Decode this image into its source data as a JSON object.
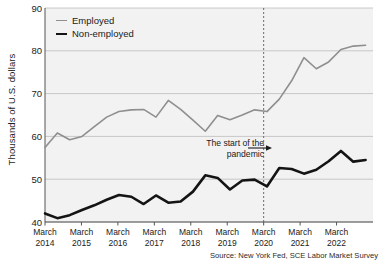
{
  "chart_data": {
    "type": "line",
    "title": "",
    "subtitle": "",
    "xlabel": "",
    "ylabel": "Thousands of U.S. dollars",
    "ylim": [
      40,
      90
    ],
    "yticks": [
      40,
      50,
      60,
      70,
      80,
      90
    ],
    "ytick_labels": [
      "40",
      "50",
      "60",
      "70",
      "80",
      "90"
    ],
    "grid": true,
    "grid_axis": "y",
    "legend_position": "top-left",
    "xtick_labels": [
      [
        "March",
        "2014"
      ],
      [
        "March",
        "2015"
      ],
      [
        "March",
        "2016"
      ],
      [
        "March",
        "2017"
      ],
      [
        "March",
        "2018"
      ],
      [
        "March",
        "2019"
      ],
      [
        "March",
        "2020"
      ],
      [
        "March",
        "2021"
      ],
      [
        "March",
        "2022"
      ]
    ],
    "x": [
      "2014-03",
      "2014-07",
      "2014-11",
      "2015-03",
      "2015-07",
      "2015-11",
      "2016-03",
      "2016-07",
      "2016-11",
      "2017-03",
      "2017-07",
      "2017-11",
      "2018-03",
      "2018-07",
      "2018-11",
      "2019-03",
      "2019-07",
      "2019-11",
      "2020-03",
      "2020-07",
      "2020-11",
      "2021-03",
      "2021-07",
      "2021-11",
      "2022-03",
      "2022-07",
      "2022-11"
    ],
    "series": [
      {
        "name": "Employed",
        "color": "#8f8f8f",
        "width": 1.6,
        "values": [
          57.4,
          60.8,
          59.2,
          60.0,
          62.3,
          64.5,
          65.8,
          66.2,
          66.3,
          64.5,
          68.4,
          66.3,
          63.8,
          61.2,
          64.9,
          63.9,
          65.0,
          66.2,
          65.8,
          68.7,
          73.0,
          78.4,
          75.8,
          77.4,
          80.3,
          81.1,
          81.3
        ]
      },
      {
        "name": "Non-employed",
        "color": "#141414",
        "width": 2.6,
        "values": [
          42.0,
          40.9,
          41.6,
          42.8,
          43.9,
          45.2,
          46.3,
          45.9,
          44.2,
          46.2,
          44.5,
          44.8,
          47.1,
          50.9,
          50.3,
          47.6,
          49.7,
          49.9,
          48.3,
          52.6,
          52.4,
          51.3,
          52.2,
          54.2,
          56.6,
          54.1,
          54.5
        ]
      }
    ],
    "annotations": [
      {
        "name": "pandemic-marker",
        "text": "The start of the\npandemic",
        "text_line1": "The start of the",
        "text_line2": "pandemic",
        "x": "2020-03",
        "marker": "vertical-dashed-line",
        "arrow": true
      }
    ],
    "source": "Source: New York Fed, SCE Labor Market Survey"
  },
  "legend": {
    "items": [
      {
        "label": "Employed"
      },
      {
        "label": "Non-employed"
      }
    ]
  },
  "axes": {
    "ylabel": "Thousands of U.S. dollars",
    "yticks": [
      "90",
      "80",
      "70",
      "60",
      "50",
      "40"
    ],
    "xticks": [
      {
        "month": "March",
        "year": "2014"
      },
      {
        "month": "March",
        "year": "2015"
      },
      {
        "month": "March",
        "year": "2016"
      },
      {
        "month": "March",
        "year": "2017"
      },
      {
        "month": "March",
        "year": "2018"
      },
      {
        "month": "March",
        "year": "2019"
      },
      {
        "month": "March",
        "year": "2020"
      },
      {
        "month": "March",
        "year": "2021"
      },
      {
        "month": "March",
        "year": "2022"
      }
    ]
  },
  "annotation": {
    "line1": "The start of the",
    "line2": "pandemic"
  },
  "source": {
    "text": "Source: New York Fed, SCE Labor Market Survey"
  },
  "colors": {
    "employed": "#8f8f8f",
    "nonemployed": "#141414",
    "plot_bg": "#f2f2f2",
    "grid": "#bdbdbd",
    "axis": "#555555"
  }
}
